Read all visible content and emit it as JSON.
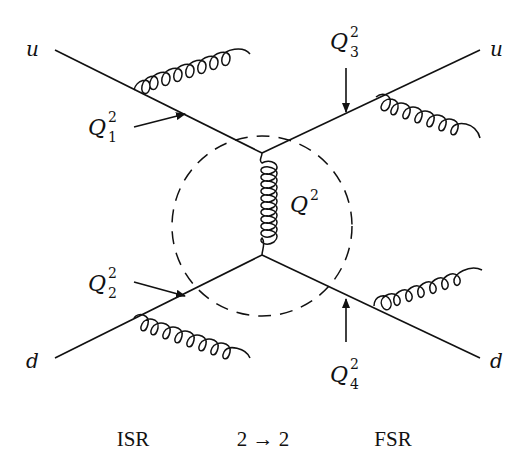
{
  "diagram": {
    "particles": {
      "in_top": "u",
      "in_bottom": "d",
      "out_top": "u",
      "out_bottom": "d"
    },
    "scales": {
      "q1": {
        "base": "Q",
        "sub": "1",
        "sup": "2"
      },
      "q2": {
        "base": "Q",
        "sub": "2",
        "sup": "2"
      },
      "q3": {
        "base": "Q",
        "sub": "3",
        "sup": "2"
      },
      "q4": {
        "base": "Q",
        "sub": "4",
        "sup": "2"
      },
      "hard": {
        "base": "Q",
        "sup": "2"
      }
    },
    "captions": {
      "isr": "ISR",
      "hard": "2 → 2",
      "fsr": "FSR"
    },
    "colors": {
      "ink": "#111111",
      "background": "#ffffff"
    }
  }
}
